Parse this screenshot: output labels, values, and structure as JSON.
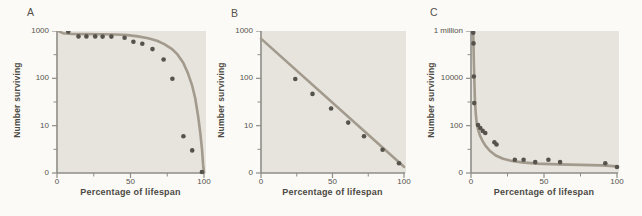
{
  "figure": {
    "xlabel": "Percentage of lifespan",
    "ylabel": "Number surviving"
  },
  "colors": {
    "page_bg": "#fbfaf7",
    "plot_bg": "#e7e4de",
    "axis": "#8f8d87",
    "curve": "#a29a8d",
    "dots": "#56524c",
    "text": "#4c4944"
  },
  "chart_data": [
    {
      "panel": "A",
      "type": "scatter-line",
      "title": "",
      "xlabel": "Percentage of lifespan",
      "ylabel": "Number surviving",
      "xlim": [
        0,
        100
      ],
      "x_ticks": {
        "labels": [
          "0",
          "50",
          "100"
        ],
        "values": [
          0,
          50,
          100
        ],
        "minor": [
          25,
          75
        ]
      },
      "y_ticks": {
        "labels": [
          "1000",
          "100",
          "10",
          "0"
        ]
      },
      "y_log": {
        "top": 1000,
        "decades": 3,
        "bottom_label_is_zero": true
      },
      "curve": [
        [
          1,
          1000
        ],
        [
          4,
          900
        ],
        [
          10,
          865
        ],
        [
          20,
          860
        ],
        [
          30,
          855
        ],
        [
          40,
          845
        ],
        [
          48,
          820
        ],
        [
          55,
          770
        ],
        [
          62,
          700
        ],
        [
          68,
          620
        ],
        [
          73,
          530
        ],
        [
          78,
          420
        ],
        [
          82,
          320
        ],
        [
          86,
          210
        ],
        [
          89,
          130
        ],
        [
          92,
          70
        ],
        [
          94,
          38
        ],
        [
          96,
          16
        ],
        [
          97.5,
          7
        ],
        [
          98.7,
          3
        ],
        [
          99.4,
          1.5
        ],
        [
          100,
          1
        ]
      ],
      "points": [
        [
          7.7,
          970
        ],
        [
          14.6,
          770
        ],
        [
          20,
          770
        ],
        [
          26,
          770
        ],
        [
          31,
          760
        ],
        [
          37,
          760
        ],
        [
          46,
          720
        ],
        [
          52,
          590
        ],
        [
          58,
          540
        ],
        [
          65,
          415
        ],
        [
          72.5,
          250
        ],
        [
          78.5,
          98
        ],
        [
          86,
          6
        ],
        [
          92,
          3
        ],
        [
          98.6,
          1
        ]
      ]
    },
    {
      "panel": "B",
      "type": "scatter-line",
      "title": "",
      "xlabel": "Percentage of lifespan",
      "ylabel": "Number surviving",
      "xlim": [
        0,
        100
      ],
      "x_ticks": {
        "labels": [
          "0",
          "50",
          "100"
        ],
        "values": [
          0,
          50,
          100
        ],
        "minor": [
          25,
          75
        ]
      },
      "y_ticks": {
        "labels": [
          "1000",
          "100",
          "10",
          "0"
        ]
      },
      "y_log": {
        "top": 1000,
        "decades": 3,
        "bottom_label_is_zero": true
      },
      "curve": [
        [
          0,
          690
        ],
        [
          100,
          1.35
        ]
      ],
      "points": [
        [
          24,
          97
        ],
        [
          36,
          47
        ],
        [
          49,
          23
        ],
        [
          61,
          11.6
        ],
        [
          72,
          6
        ],
        [
          85,
          3.1
        ],
        [
          96.5,
          1.6
        ]
      ]
    },
    {
      "panel": "C",
      "type": "scatter-line",
      "title": "",
      "xlabel": "Percentage of lifespan",
      "ylabel": "Number surviving",
      "xlim": [
        0,
        100
      ],
      "x_ticks": {
        "labels": [
          "0",
          "50",
          "100"
        ],
        "values": [
          0,
          50,
          100
        ],
        "minor": [
          25,
          75
        ]
      },
      "y_ticks": {
        "labels": [
          "1 million",
          "10000",
          "100",
          "0"
        ]
      },
      "y_log": {
        "top": 1000000,
        "decades": 6,
        "bottom_label_is_zero": true
      },
      "curve": [
        [
          1.5,
          1000000
        ],
        [
          1.7,
          250000
        ],
        [
          2,
          40000
        ],
        [
          2.3,
          7000
        ],
        [
          2.7,
          1300
        ],
        [
          3.2,
          350
        ],
        [
          3.9,
          130
        ],
        [
          4.8,
          70
        ],
        [
          6,
          40
        ],
        [
          8,
          22
        ],
        [
          10,
          14
        ],
        [
          13,
          8.5
        ],
        [
          17,
          5.5
        ],
        [
          22,
          4
        ],
        [
          28,
          3.2
        ],
        [
          35,
          2.8
        ],
        [
          45,
          2.5
        ],
        [
          60,
          2.3
        ],
        [
          75,
          2.2
        ],
        [
          90,
          2.1
        ],
        [
          100,
          1.9
        ]
      ],
      "points": [
        [
          1.5,
          850000
        ],
        [
          1.7,
          300000
        ],
        [
          1.9,
          12000
        ],
        [
          2.2,
          900
        ],
        [
          4.8,
          107
        ],
        [
          6.4,
          80
        ],
        [
          8,
          60
        ],
        [
          9.8,
          49
        ],
        [
          16,
          20
        ],
        [
          17.5,
          16
        ],
        [
          30,
          3.6
        ],
        [
          36,
          3.6
        ],
        [
          44,
          2.9
        ],
        [
          53,
          3.6
        ],
        [
          61,
          2.9
        ],
        [
          92,
          2.6
        ],
        [
          100,
          1.8
        ]
      ]
    }
  ]
}
